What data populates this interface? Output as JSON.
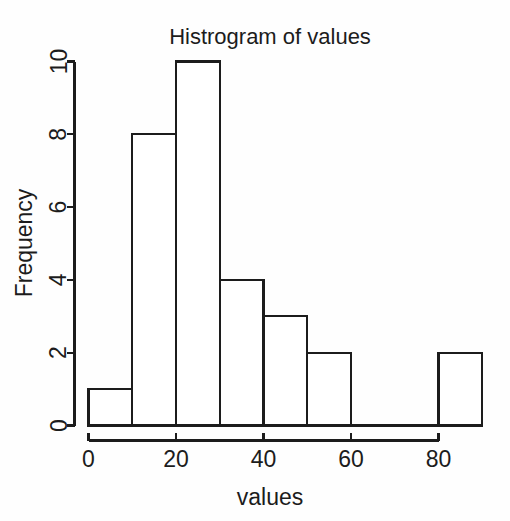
{
  "chart_data": {
    "type": "bar",
    "title": "Histrogram of values",
    "xlabel": "values",
    "ylabel": "Frequency",
    "xlim": [
      0,
      90
    ],
    "ylim": [
      0,
      10
    ],
    "grid": false,
    "legend": null,
    "bin_width": 10,
    "bin_edges": [
      0,
      10,
      20,
      30,
      40,
      50,
      60,
      70,
      80,
      90
    ],
    "categories": [
      "0-10",
      "10-20",
      "20-30",
      "30-40",
      "40-50",
      "50-60",
      "60-70",
      "70-80",
      "80-90"
    ],
    "values": [
      1,
      8,
      10,
      4,
      3,
      2,
      0,
      0,
      2
    ],
    "bars": [
      {
        "x0": 0,
        "x1": 10,
        "height": 1
      },
      {
        "x0": 10,
        "x1": 20,
        "height": 8
      },
      {
        "x0": 20,
        "x1": 30,
        "height": 10
      },
      {
        "x0": 30,
        "x1": 40,
        "height": 4
      },
      {
        "x0": 40,
        "x1": 50,
        "height": 3
      },
      {
        "x0": 50,
        "x1": 60,
        "height": 2
      },
      {
        "x0": 60,
        "x1": 70,
        "height": 0
      },
      {
        "x0": 70,
        "x1": 80,
        "height": 0
      },
      {
        "x0": 80,
        "x1": 90,
        "height": 2
      }
    ],
    "xticks": [
      0,
      20,
      40,
      60,
      80
    ],
    "xtick_labels": [
      "0",
      "20",
      "40",
      "60",
      "80"
    ],
    "yticks": [
      0,
      2,
      4,
      6,
      8,
      10
    ],
    "ytick_labels": [
      "0",
      "2",
      "4",
      "6",
      "8",
      "10"
    ],
    "total_count": 30,
    "colors": {
      "line": "#1c1c1c",
      "bar_fill": "#ffffff",
      "background": "#fefefe",
      "text": "#1c1c1c"
    }
  },
  "figure": {
    "title": "Histrogram of values",
    "x_axis_title": "values",
    "y_axis_title": "Frequency"
  }
}
